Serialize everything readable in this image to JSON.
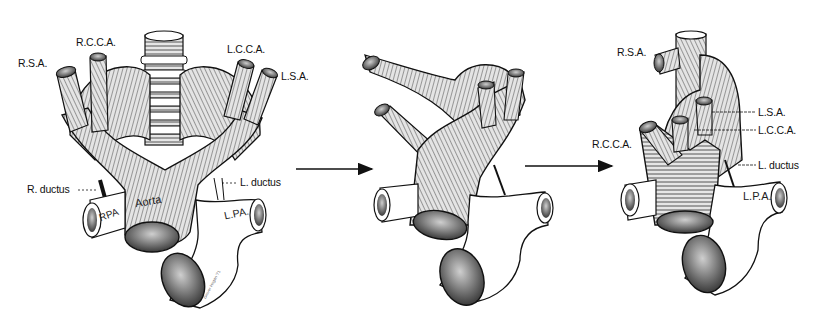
{
  "figure": {
    "panels": [
      {
        "id": "panel-1",
        "labels": {
          "rsa": "R.S.A.",
          "rcca": "R.C.C.A.",
          "lcca": "L.C.C.A.",
          "lsa": "L.S.A.",
          "r_ductus": "R. ductus",
          "l_ductus": "L. ductus",
          "aorta": "Aorta",
          "rpa": "RPA",
          "lpa": "L.PA."
        },
        "signature": "Grover Hogan '71"
      },
      {
        "id": "panel-2",
        "labels": {}
      },
      {
        "id": "panel-3",
        "labels": {
          "rsa": "R.S.A.",
          "lsa": "L.S.A.",
          "lcca": "L.C.C.A.",
          "rcca": "R.C.C.A.",
          "l_ductus": "L. ductus",
          "lpa": "L.P.A."
        }
      }
    ],
    "arrows": [
      {
        "from": "panel-1",
        "to": "panel-2"
      },
      {
        "from": "panel-2",
        "to": "panel-3"
      }
    ],
    "colors": {
      "ink": "#111111",
      "vessel_fill": "#d6d6d6",
      "vessel_shade": "#9a9a9a",
      "pa_fill": "#ffffff",
      "background": "#ffffff"
    }
  }
}
